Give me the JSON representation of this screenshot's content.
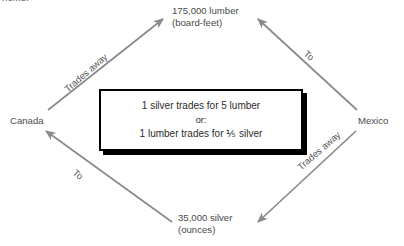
{
  "figure": {
    "clipped_caption": "home."
  },
  "nodes": [
    {
      "id": "lumber",
      "line1": "175,000 lumber",
      "line2": "(board-feet)"
    },
    {
      "id": "silver",
      "line1": "35,000 silver",
      "line2": "(ounces)"
    },
    {
      "id": "canada",
      "line1": "Canada",
      "line2": ""
    },
    {
      "id": "mexico",
      "line1": "Mexico",
      "line2": ""
    }
  ],
  "edges": [
    {
      "id": "canada-lumber",
      "label": "Trades away",
      "from": "Canada",
      "to": "175,000 lumber"
    },
    {
      "id": "mexico-lumber",
      "label": "To",
      "from": "Mexico",
      "to": "175,000 lumber"
    },
    {
      "id": "silver-canada",
      "label": "To",
      "from": "35,000 silver",
      "to": "Canada"
    },
    {
      "id": "mexico-silver",
      "label": "Trades away",
      "from": "Mexico",
      "to": "35,000 silver"
    }
  ],
  "callout": {
    "line1": "1 silver trades for 5 lumber",
    "line2": "or:",
    "line3": "1 lumber trades for ⅕ silver"
  },
  "colors": {
    "arrow": "#8a8a8a",
    "text": "#4a4a4a",
    "callout_border": "#000000",
    "background": "#ffffff"
  }
}
